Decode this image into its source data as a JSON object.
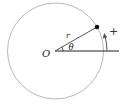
{
  "diagram": {
    "labels": {
      "origin": "O",
      "radius": "r",
      "angle": "θ",
      "direction": "+"
    },
    "colors": {
      "circle": "#b8b8b8",
      "lines": "#222222",
      "arrow": "#555555"
    },
    "geometry": {
      "center": [
        55,
        51
      ],
      "circle_radius": 48,
      "point": [
        97,
        27
      ],
      "angle_deg": 30
    }
  }
}
